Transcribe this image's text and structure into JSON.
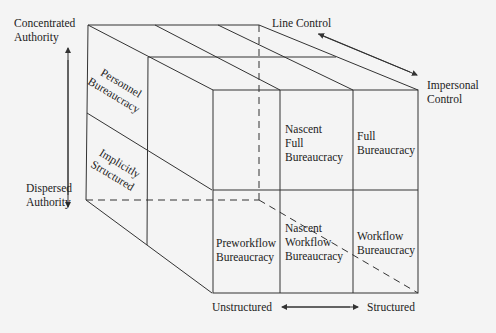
{
  "axes": {
    "vertical": {
      "top_label": [
        "Concentrated",
        "Authority"
      ],
      "bottom_label": [
        "Dispersed",
        "Authority"
      ]
    },
    "depth": {
      "back_label": [
        "Line Control"
      ],
      "front_label": [
        "Impersonal",
        "Control"
      ]
    },
    "horizontal": {
      "left_label": "Unstructured",
      "right_label": "Structured"
    }
  },
  "cells": {
    "personnel": [
      "Personnel",
      "Bureaucracy"
    ],
    "implicitly": [
      "Implicitly",
      "Structured"
    ],
    "nascent_full": [
      "Nascent",
      "Full",
      "Bureaucracy"
    ],
    "full": [
      "Full",
      "Bureaucracy"
    ],
    "preworkflow": [
      "Preworkflow",
      "Bureaucracy"
    ],
    "nascent_workflow": [
      "Nascent",
      "Workflow",
      "Bureaucracy"
    ],
    "workflow": [
      "Workflow",
      "Bureaucracy"
    ]
  },
  "colors": {
    "line": "#333333",
    "background": "#f4f4f4"
  }
}
